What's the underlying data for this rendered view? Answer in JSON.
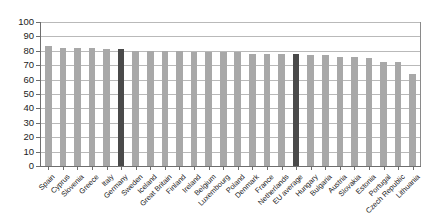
{
  "chart_data": {
    "type": "bar",
    "title": "",
    "subtitle": "",
    "xlabel": "",
    "ylabel": "",
    "ylim": [
      0,
      100
    ],
    "ytick_values": [
      0,
      10,
      20,
      30,
      40,
      50,
      60,
      70,
      80,
      90,
      100
    ],
    "ytick_labels": [
      "0",
      "10",
      "20",
      "30",
      "40",
      "50",
      "60",
      "70",
      "80",
      "90",
      "100"
    ],
    "grid": "horizontal",
    "legend": "none",
    "categories": [
      "Spain",
      "Cyprus",
      "Slovenia",
      "Greece",
      "Italy",
      "Germany",
      "Sweden",
      "Iceland",
      "Great Britain",
      "Finland",
      "Ireland",
      "Belgium",
      "Luxembourg",
      "Poland",
      "Denmark",
      "France",
      "Netherlands",
      "EU average",
      "Hungary",
      "Bulgaria",
      "Austria",
      "Slovakia",
      "Estonia",
      "Portugal",
      "Czech Republic",
      "Lithuania"
    ],
    "values": [
      83,
      82,
      82,
      82,
      81,
      81,
      80,
      80,
      80,
      80,
      79,
      79,
      79,
      79,
      78,
      78,
      78,
      78,
      77,
      77,
      76,
      76,
      75,
      72,
      72,
      64
    ],
    "highlighted_categories": [
      "Germany",
      "EU average"
    ],
    "colors": {
      "bar": "#a8a8a8",
      "bar_highlight": "#4a4a4a",
      "grid": "#b9b9b9",
      "axis": "#6e6e6e",
      "text": "#1b1b1b",
      "background": "#ffffff"
    }
  }
}
